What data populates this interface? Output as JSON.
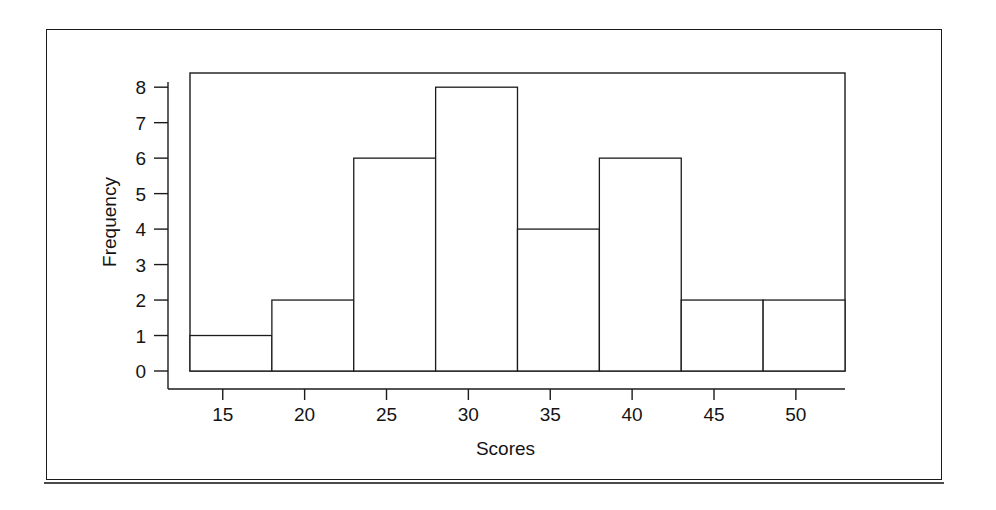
{
  "figure": {
    "background_color": "#ffffff",
    "line_color": "#1b1b1b",
    "bar_fill": "#ffffff",
    "has_outer_border": true
  },
  "chart_data": {
    "type": "bar",
    "subtype": "histogram",
    "title": "",
    "xlabel": "Scores",
    "ylabel": "Frequency",
    "xlim": [
      13,
      53
    ],
    "ylim": [
      0,
      8.4
    ],
    "grid": false,
    "legend": null,
    "bin_width": 5,
    "bin_edges": [
      13,
      18,
      23,
      28,
      33,
      38,
      43,
      48,
      53
    ],
    "categories": [
      "13-18",
      "18-23",
      "23-28",
      "28-33",
      "33-38",
      "38-43",
      "43-48",
      "48-53"
    ],
    "values": [
      1,
      2,
      6,
      8,
      4,
      6,
      2,
      2
    ],
    "xticks": [
      15,
      20,
      25,
      30,
      35,
      40,
      45,
      50
    ],
    "xtick_labels": [
      "15",
      "20",
      "25",
      "30",
      "35",
      "40",
      "45",
      "50"
    ],
    "yticks": [
      0,
      1,
      2,
      3,
      4,
      5,
      6,
      7,
      8
    ],
    "ytick_labels": [
      "0",
      "1",
      "2",
      "3",
      "4",
      "5",
      "6",
      "7",
      "8"
    ],
    "total_count": 31
  }
}
